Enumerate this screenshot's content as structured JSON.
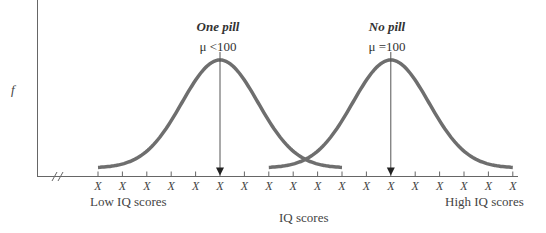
{
  "diagram": {
    "y_axis_label": "f",
    "x_axis_title": "IQ scores",
    "low_label": "Low IQ scores",
    "high_label": "High IQ scores",
    "tick_label": "X",
    "tick_count": 18,
    "curves": [
      {
        "name": "One pill",
        "mean_label": "μ <100",
        "center_tick_index": 5
      },
      {
        "name": "No pill",
        "mean_label": "μ =100",
        "center_tick_index": 12
      }
    ],
    "colors": {
      "curve": "#6e6e6e",
      "axis": "#666666",
      "arrow": "#222222"
    }
  }
}
